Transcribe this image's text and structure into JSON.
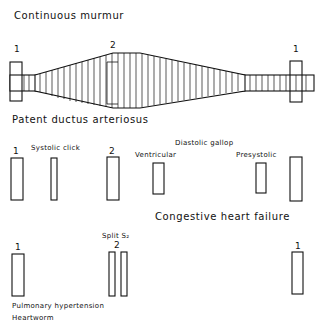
{
  "sections": {
    "continuous": {
      "title": "Continuous murmur",
      "label_s1_left": "1",
      "label_s2": "2",
      "label_s1_right": "1"
    },
    "pda": {
      "title": "Patent ductus arteriosus",
      "label_s1_left": "1",
      "label_click": "Systolic click",
      "label_s2": "2",
      "label_gallop": "Diastolic gallop",
      "label_ventricular": "Ventricular",
      "label_presystolic": "Presystolic"
    },
    "chf": {
      "title": "Congestive heart failure",
      "label_s1_left": "1",
      "label_split": "Split S₂",
      "label_s2": "2",
      "label_s1_right": "1",
      "caption_line1": "Pulmonary  hypertension",
      "caption_line2": "Heartworm"
    }
  },
  "colors": {
    "ink": "#111111",
    "background": "#ffffff"
  }
}
